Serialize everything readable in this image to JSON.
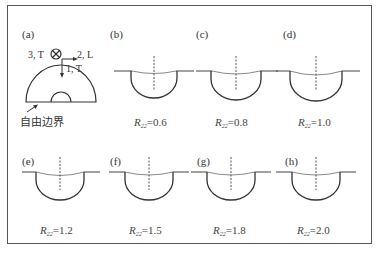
{
  "figure": {
    "panel_a": {
      "label": "(a)",
      "axis_out": "3, T",
      "axis_right": "2, L",
      "axis_down": "1, T",
      "free_boundary": "自由边界"
    },
    "panels": [
      {
        "label": "(b)",
        "r_symbol": "R",
        "r_sub": "22",
        "r_value": "=0.6"
      },
      {
        "label": "(c)",
        "r_symbol": "R",
        "r_sub": "22",
        "r_value": "=0.8"
      },
      {
        "label": "(d)",
        "r_symbol": "R",
        "r_sub": "22",
        "r_value": "=1.0"
      },
      {
        "label": "(e)",
        "r_symbol": "R",
        "r_sub": "22",
        "r_value": "=1.2"
      },
      {
        "label": "(f)",
        "r_symbol": "R",
        "r_sub": "22",
        "r_value": "=1.5"
      },
      {
        "label": "(g)",
        "r_symbol": "R",
        "r_sub": "22",
        "r_value": "=1.8"
      },
      {
        "label": "(h)",
        "r_symbol": "R",
        "r_sub": "22",
        "r_value": "=2.0"
      }
    ]
  }
}
